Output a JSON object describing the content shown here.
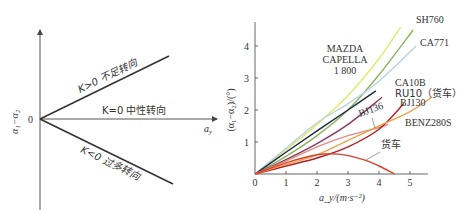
{
  "left_diagram": {
    "y_axis_label": "α₁−α₂",
    "x_axis_label": "a",
    "x_axis_sub": "y",
    "origin_label": "0",
    "lines": [
      {
        "label": "K>0 不足转向",
        "kind": "understeer"
      },
      {
        "label": "K=0 中性转向",
        "kind": "neutral"
      },
      {
        "label": "K<0 过多转向",
        "kind": "oversteer"
      }
    ]
  },
  "chart_data": {
    "type": "line",
    "title": "",
    "xlabel": "a_y/(m·s⁻²)",
    "ylabel": "(α₁−α₂)/(°)",
    "xlim": [
      0,
      6
    ],
    "ylim": [
      0,
      4.8
    ],
    "x_ticks": [
      "0",
      "1",
      "2",
      "3",
      "4",
      "5"
    ],
    "y_ticks": [
      "1",
      "2",
      "3",
      "4"
    ],
    "grid": false,
    "series": [
      {
        "name": "MAZDA CAPELLA 1 800",
        "color": "#e3e86a",
        "points": [
          [
            0,
            0
          ],
          [
            1,
            0.75
          ],
          [
            2,
            1.55
          ],
          [
            3,
            2.45
          ],
          [
            4,
            3.6
          ],
          [
            4.7,
            4.6
          ]
        ]
      },
      {
        "name": "SH760",
        "color": "#8cb35a",
        "points": [
          [
            0,
            0
          ],
          [
            1,
            0.55
          ],
          [
            2,
            1.2
          ],
          [
            3,
            2.0
          ],
          [
            4,
            3.1
          ],
          [
            5.1,
            4.5
          ]
        ]
      },
      {
        "name": "CA771",
        "color": "#b9d3e3",
        "points": [
          [
            0,
            0
          ],
          [
            1,
            0.8
          ],
          [
            2,
            1.6
          ],
          [
            3,
            2.2
          ],
          [
            4,
            2.9
          ],
          [
            5.2,
            4.0
          ]
        ]
      },
      {
        "name": "CA10B",
        "color": "#1e2a44",
        "points": [
          [
            0,
            0
          ],
          [
            1,
            0.68
          ],
          [
            2,
            1.35
          ],
          [
            3,
            2.0
          ],
          [
            3.9,
            2.6
          ]
        ]
      },
      {
        "name": "RU10（货车）",
        "color": "#8a3b5c",
        "points": [
          [
            0,
            0
          ],
          [
            1,
            0.45
          ],
          [
            2,
            0.95
          ],
          [
            3,
            1.55
          ],
          [
            4.1,
            2.4
          ]
        ]
      },
      {
        "name": "BJ136",
        "color": "#e08a8a",
        "points": [
          [
            0,
            0
          ],
          [
            1,
            0.4
          ],
          [
            2,
            0.85
          ],
          [
            3,
            1.2
          ],
          [
            4,
            1.45
          ],
          [
            4.3,
            1.55
          ]
        ]
      },
      {
        "name": "BJ130",
        "color": "#b11f22",
        "points": [
          [
            0,
            0
          ],
          [
            1,
            0.25
          ],
          [
            2,
            0.5
          ],
          [
            3,
            0.85
          ],
          [
            4,
            1.4
          ],
          [
            4.8,
            2.2
          ]
        ]
      },
      {
        "name": "BENZ280S",
        "color": "#f0a04b",
        "points": [
          [
            0,
            0
          ],
          [
            1,
            0.3
          ],
          [
            2,
            0.6
          ],
          [
            3,
            1.05
          ],
          [
            4,
            1.5
          ],
          [
            5,
            1.95
          ],
          [
            5.7,
            2.4
          ]
        ]
      },
      {
        "name": "货车",
        "color": "#e0412b",
        "points": [
          [
            0,
            0
          ],
          [
            1,
            0.35
          ],
          [
            2,
            0.6
          ],
          [
            2.7,
            0.62
          ],
          [
            3.5,
            0.45
          ],
          [
            4,
            0.25
          ],
          [
            4.5,
            0
          ]
        ]
      }
    ],
    "annotations": [
      "MAZDA",
      "CAPELLA",
      "1 800",
      "SH760",
      "CA771",
      "CA10B",
      "RU10（货车）",
      "BJ136",
      "BJ130",
      "BENZ280S",
      "货车"
    ]
  }
}
